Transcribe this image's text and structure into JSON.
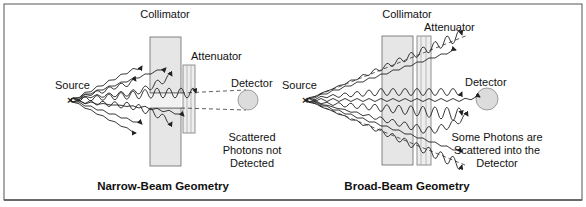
{
  "figure": {
    "panels": [
      {
        "title": "Narrow-Beam Geometry",
        "labels": {
          "collimator": "Collimator",
          "attenuator": "Attenuator",
          "source": "Source",
          "detector": "Detector",
          "note_lines": [
            "Scattered",
            "Photons not",
            "Detected"
          ]
        }
      },
      {
        "title": "Broad-Beam Geometry",
        "labels": {
          "collimator": "Collimator",
          "attenuator": "Attenuator",
          "source": "Source",
          "detector": "Detector",
          "note_lines": [
            "Some Photons are",
            "Scattered into the",
            "Detector"
          ]
        }
      }
    ],
    "colors": {
      "collimator_fill": "#e6e6e6",
      "detector_fill": "#dcdcdc",
      "stroke": "#333333",
      "border": "#555555"
    }
  }
}
